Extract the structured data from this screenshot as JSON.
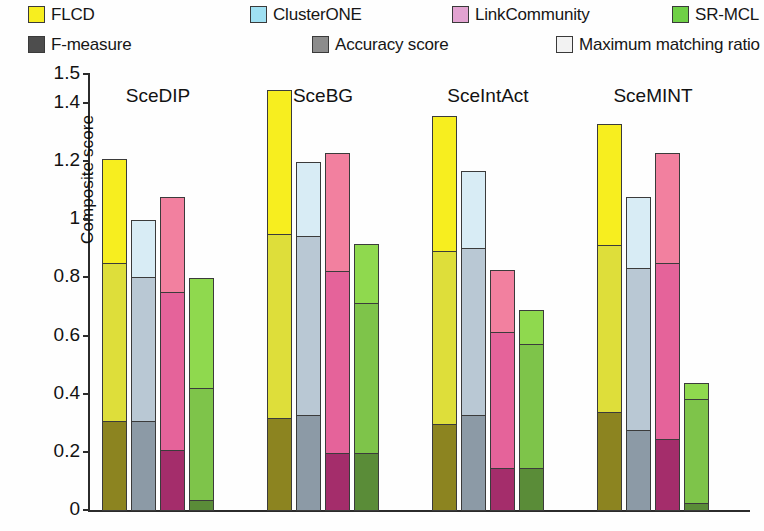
{
  "legend": {
    "series_entries": [
      {
        "label": "FLCD",
        "color": "#f7ee1f",
        "icon": "color-swatch-icon",
        "x": 28,
        "y": 6
      },
      {
        "label": "ClusterONE",
        "color": "#9fe0f2",
        "icon": "color-swatch-icon",
        "x": 250,
        "y": 6
      },
      {
        "label": "LinkCommunity",
        "color": "#e2a3d1",
        "icon": "color-swatch-icon",
        "x": 452,
        "y": 6
      },
      {
        "label": "SR-MCL",
        "color": "#6fd046",
        "icon": "color-swatch-icon",
        "x": 672,
        "y": 6
      }
    ],
    "metric_entries": [
      {
        "label": "F-measure",
        "color": "#4d4d4d",
        "icon": "color-swatch-icon",
        "x": 28,
        "y": 36
      },
      {
        "label": "Accuracy score",
        "color": "#8c8c8c",
        "icon": "color-swatch-icon",
        "x": 312,
        "y": 36
      },
      {
        "label": "Maximum matching ratio",
        "color": "#f2f2f2",
        "icon": "color-swatch-icon",
        "x": 556,
        "y": 36
      }
    ]
  },
  "axes": {
    "y_title": "Composite score",
    "y_ticks": [
      "0",
      "0.2",
      "0.4",
      "0.6",
      "0.8",
      "1",
      "1.2",
      "1.4",
      "1.5"
    ],
    "x_ticks": [
      "SceDIP",
      "SceBG",
      "SceIntAct",
      "SceMINT"
    ]
  },
  "chart_data": {
    "type": "bar",
    "title": "",
    "xlabel": "",
    "ylabel": "Composite score",
    "ylim": [
      0,
      1.5
    ],
    "yticks": [
      0,
      0.2,
      0.4,
      0.6,
      0.8,
      1.0,
      1.2,
      1.4,
      1.5
    ],
    "grid": false,
    "stacked": true,
    "grouped": true,
    "legend_position": "top",
    "categories": [
      "SceDIP",
      "SceBG",
      "SceIntAct",
      "SceMINT"
    ],
    "methods": [
      "FLCD",
      "ClusterONE",
      "LinkCommunity",
      "SR-MCL"
    ],
    "method_colors": {
      "FLCD": "#f7ee1f",
      "ClusterONE": "#9fe0f2",
      "LinkCommunity": "#e2a3d1",
      "SR-MCL": "#6fd046"
    },
    "stack_segments": [
      "F-measure",
      "Accuracy score",
      "Maximum matching ratio"
    ],
    "segment_shades": {
      "F-measure": "dark",
      "Accuracy score": "mid",
      "Maximum matching ratio": "light"
    },
    "series": [
      {
        "name": "F-measure",
        "values": {
          "FLCD": [
            0.31,
            0.32,
            0.3,
            0.34
          ],
          "ClusterONE": [
            0.31,
            0.33,
            0.33,
            0.28
          ],
          "LinkCommunity": [
            0.21,
            0.2,
            0.15,
            0.25
          ],
          "SR-MCL": [
            0.04,
            0.2,
            0.15,
            0.03
          ]
        }
      },
      {
        "name": "Accuracy score",
        "values": {
          "FLCD": [
            0.55,
            0.64,
            0.6,
            0.58
          ],
          "ClusterONE": [
            0.5,
            0.62,
            0.58,
            0.56
          ],
          "LinkCommunity": [
            0.55,
            0.63,
            0.47,
            0.61
          ],
          "SR-MCL": [
            0.39,
            0.52,
            0.43,
            0.36
          ]
        }
      },
      {
        "name": "Maximum matching ratio",
        "values": {
          "FLCD": [
            0.36,
            0.5,
            0.47,
            0.42
          ],
          "ClusterONE": [
            0.2,
            0.26,
            0.27,
            0.25
          ],
          "LinkCommunity": [
            0.33,
            0.41,
            0.22,
            0.38
          ],
          "SR-MCL": [
            0.38,
            0.21,
            0.12,
            0.06
          ]
        }
      }
    ],
    "totals": {
      "FLCD": [
        1.22,
        1.46,
        1.37,
        1.34
      ],
      "ClusterONE": [
        1.01,
        1.21,
        1.18,
        1.09
      ],
      "LinkCommunity": [
        1.09,
        1.24,
        0.84,
        1.24
      ],
      "SR-MCL": [
        0.81,
        0.93,
        0.7,
        0.45
      ]
    }
  }
}
